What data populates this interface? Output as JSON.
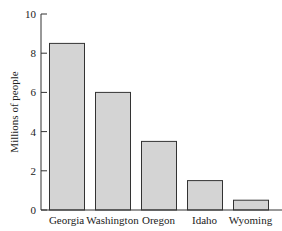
{
  "chart_data": {
    "type": "bar",
    "title": "",
    "xlabel": "",
    "ylabel": "Millions of people",
    "categories": [
      "Georgia",
      "Washington",
      "Oregon",
      "Idaho",
      "Wyoming"
    ],
    "values": [
      8.5,
      6.0,
      3.5,
      1.5,
      0.5
    ],
    "ylim": [
      0,
      10
    ],
    "yticks": [
      0,
      2,
      4,
      6,
      8,
      10
    ],
    "grid": false,
    "legend": null,
    "colors": {
      "bar_fill": "#d4d4d4",
      "bar_stroke": "#333333",
      "axis": "#333333"
    }
  }
}
